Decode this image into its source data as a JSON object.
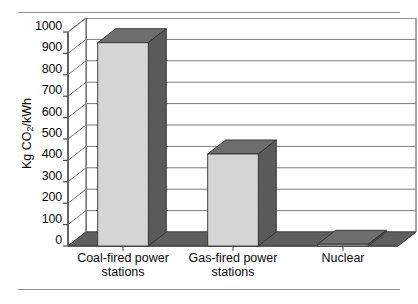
{
  "figure": {
    "has_top_rule": true,
    "has_bottom_rule": true,
    "rule_color": "#8d8d8d"
  },
  "axis": {
    "y_title_main": "Kg CO",
    "y_title_sub": "2",
    "y_title_tail": "/kWh",
    "y_title_plain": "Kg CO2/kWh",
    "ticks": [
      "0",
      "100",
      "200",
      "300",
      "400",
      "500",
      "600",
      "700",
      "800",
      "900",
      "1000"
    ]
  },
  "colors": {
    "bar_front": "#d5d5d5",
    "bar_top": "#6e6e6e",
    "bar_side": "#5a5a5a",
    "floor": "#5f5f5f",
    "floor_light": "#a8a8a8",
    "wall_line": "#7d7d7d",
    "frame": "#4a4a4a",
    "text": "#0a0a0a"
  },
  "chart_data": {
    "type": "bar",
    "title": "",
    "subtitle": "",
    "xlabel": "",
    "ylabel": "Kg CO2/kWh",
    "categories": [
      "Coal-fired power stations",
      "Gas-fired power stations",
      "Nuclear"
    ],
    "category_lines": [
      [
        "Coal-fired power",
        "stations"
      ],
      [
        "Gas-fired power",
        "stations"
      ],
      [
        "Nuclear"
      ]
    ],
    "values": [
      950,
      430,
      8
    ],
    "ylim": [
      0,
      1000
    ],
    "ytick_step": 100,
    "grid": true,
    "grid_axis": "y",
    "legend": false,
    "three_d": true,
    "series": [
      {
        "name": "CO2 emissions",
        "values": [
          950,
          430,
          8
        ]
      }
    ]
  }
}
